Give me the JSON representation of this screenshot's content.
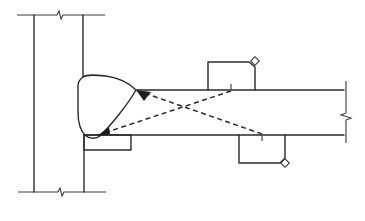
{
  "diagram": {
    "title": "Ultrasonic angle-beam inspection of column-to-flange weld",
    "colors": {
      "line": "#2b2b2b",
      "background": "#ffffff",
      "arrowhead": "#1e1e1e"
    },
    "components": {
      "column": "column",
      "plate": "flange-plate",
      "weld": "weld-bead",
      "backing_bar": "backing-bar",
      "probe_top": "top-probe",
      "probe_bottom": "bottom-probe",
      "beam_top": "sound-beam-from-top-probe",
      "beam_bottom": "sound-beam-from-bottom-probe"
    },
    "labels": []
  }
}
